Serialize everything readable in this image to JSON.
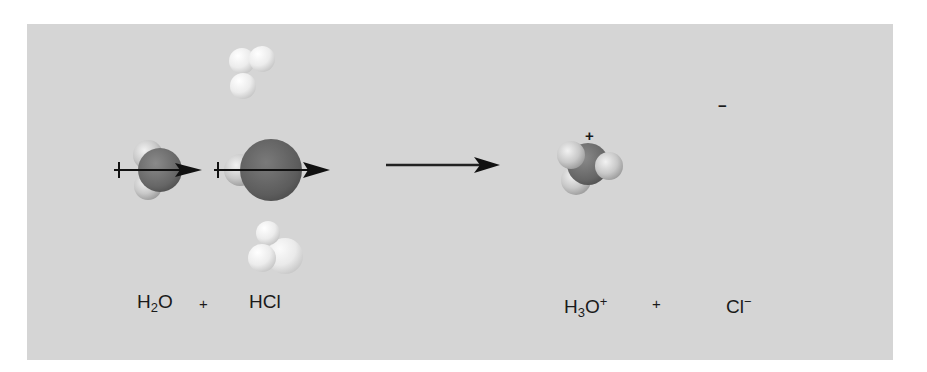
{
  "figure": {
    "background_color": "#d5d5d5"
  },
  "equation": {
    "reactant_1": {
      "base": "H",
      "sub": "2",
      "tail": "O"
    },
    "plus_1": "+",
    "reactant_2": "HCl",
    "product_1": {
      "base": "H",
      "sub": "3",
      "tail": "O",
      "sup": "+"
    },
    "plus_2": "+",
    "product_2": {
      "base": "Cl",
      "sup": "−"
    }
  },
  "molecules": {
    "water": {
      "label": "H2O",
      "dipole_arrow": true
    },
    "hydrogen_chloride": {
      "label": "HCl",
      "dipole_arrow": true
    },
    "hydronium": {
      "label": "H3O+",
      "charge": "+"
    },
    "chloride": {
      "label": "Cl−",
      "charge": "−"
    },
    "surrounding_waters": 3
  },
  "colors": {
    "oxygen": "#6a6a6a",
    "chlorine": "#5e5e5e",
    "hydrogen": "#e6e6e6",
    "arrow": "#111111"
  }
}
